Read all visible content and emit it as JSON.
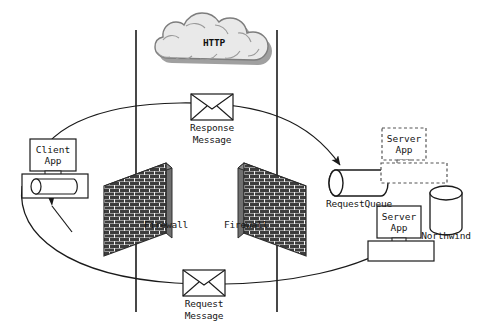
{
  "diagram": {
    "cloud": {
      "label": "HTTP",
      "fill": "#e8e8e8",
      "stroke": "#8a8a8a",
      "shadow": "#9c9c9c"
    },
    "nodes": [
      {
        "id": "client-app",
        "label_line1": "Client",
        "label_line2": "App",
        "type": "app-box-with-queue",
        "queue_label": ""
      },
      {
        "id": "request-queue",
        "label": "RequestQueue",
        "type": "horizontal-cylinder"
      },
      {
        "id": "server-app-ghost",
        "label_line1": "Server",
        "label_line2": "App",
        "type": "app-box-dashed"
      },
      {
        "id": "server-app",
        "label_line1": "Server",
        "label_line2": "App",
        "type": "app-box-solid"
      },
      {
        "id": "northwind",
        "label": "Northwind",
        "type": "database-cylinder"
      }
    ],
    "firewalls": [
      {
        "id": "firewall-left",
        "label": "Firewall"
      },
      {
        "id": "firewall-right",
        "label": "Firewall"
      }
    ],
    "messages": [
      {
        "id": "response-message",
        "label_line1": "Response",
        "label_line2": "Message"
      },
      {
        "id": "request-message",
        "label_line1": "Request",
        "label_line2": "Message"
      }
    ],
    "colors": {
      "line": "#1a1a1a",
      "brick_dark": "#3a3a3a",
      "brick_light": "#f2f2f2",
      "brick_edge": "#585858",
      "background": "#ffffff"
    }
  }
}
